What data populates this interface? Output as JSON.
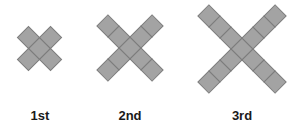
{
  "figures": [
    {
      "label": "1st",
      "arm_length": 1,
      "squares": 5,
      "center": [
        39.5,
        48.5
      ]
    },
    {
      "label": "2nd",
      "arm_length": 2,
      "squares": 9,
      "center": [
        130,
        48
      ]
    },
    {
      "label": "3rd",
      "arm_length": 3,
      "squares": 13,
      "center": [
        242,
        49
      ]
    }
  ],
  "style": {
    "square_fill": "#a3a3a3",
    "square_stroke": "#7c7c7c",
    "square_side": 15.6
  }
}
